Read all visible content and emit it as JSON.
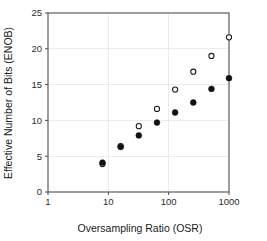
{
  "chart_data": {
    "type": "scatter",
    "title": "",
    "xlabel": "Oversampling Ratio (OSR)",
    "ylabel": "Effective Number of Bits (ENOB)",
    "xscale": "log",
    "yscale": "linear",
    "xlim": [
      1,
      1000
    ],
    "ylim": [
      0,
      25
    ],
    "xticks": [
      1,
      10,
      100,
      1000
    ],
    "xtick_labels": [
      "1",
      "10",
      "100",
      "1000"
    ],
    "yticks": [
      0,
      5,
      10,
      15,
      20,
      25
    ],
    "ytick_labels": [
      "0",
      "5",
      "10",
      "15",
      "20",
      "25"
    ],
    "grid": true,
    "grid_color": "#e6e6e6",
    "legend": "none",
    "frame_color": "#4d4d4d",
    "series": [
      {
        "name": "open-circles",
        "marker": "open-circle",
        "color": "#1a1a1a",
        "fill": "#ffffff",
        "x": [
          8,
          16,
          32,
          64,
          128,
          256,
          512,
          1000
        ],
        "y": [
          3.9,
          6.4,
          9.2,
          11.6,
          14.3,
          16.8,
          19.0,
          21.6
        ]
      },
      {
        "name": "filled-circles",
        "marker": "filled-circle",
        "color": "#111111",
        "fill": "#111111",
        "x": [
          8,
          16,
          32,
          64,
          128,
          256,
          512,
          1000
        ],
        "y": [
          4.1,
          6.3,
          7.9,
          9.7,
          11.1,
          12.5,
          14.4,
          15.9
        ]
      }
    ]
  }
}
